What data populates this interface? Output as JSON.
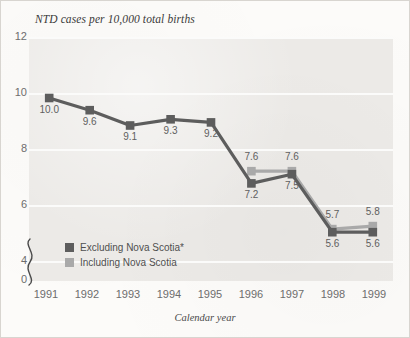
{
  "chart_data": {
    "type": "line",
    "title": "NTD cases per 10,000 total births",
    "xlabel": "Calendar year",
    "ylabel": "",
    "categories": [
      "1991",
      "1992",
      "1993",
      "1994",
      "1995",
      "1996",
      "1997",
      "1998",
      "1999"
    ],
    "x": [
      1991,
      1992,
      1993,
      1994,
      1995,
      1996,
      1997,
      1998,
      1999
    ],
    "ylim": [
      4,
      12
    ],
    "y_ticks": [
      "12",
      "10",
      "8",
      "6",
      "4",
      "0"
    ],
    "y_tick_values": [
      12,
      10,
      8,
      6,
      4,
      0
    ],
    "axis_break": true,
    "axis_break_between": [
      0,
      4
    ],
    "grid": true,
    "grid_axis": "y",
    "legend_position": "inside-bottom-left",
    "series": [
      {
        "name": "Excluding Nova Scotia*",
        "color": "#5d5d5d",
        "values": [
          10.0,
          9.6,
          9.1,
          9.3,
          9.2,
          7.2,
          7.5,
          5.6,
          5.6
        ],
        "labels": [
          "10.0",
          "9.6",
          "9.1",
          "9.3",
          "9.2",
          "7.2",
          "7.5",
          "5.6",
          "5.6"
        ],
        "label_positions": [
          "below",
          "below",
          "below",
          "below",
          "below",
          "below",
          "below",
          "below",
          "below"
        ]
      },
      {
        "name": "Including Nova Scotia",
        "color": "#a9a9a9",
        "values": [
          null,
          null,
          null,
          null,
          null,
          7.6,
          7.6,
          5.7,
          5.8
        ],
        "labels": [
          "",
          "",
          "",
          "",
          "",
          "7.6",
          "7.6",
          "5.7",
          "5.8"
        ],
        "label_positions": [
          "",
          "",
          "",
          "",
          "",
          "above",
          "above",
          "above",
          "above"
        ]
      }
    ]
  },
  "chart": {
    "title": "NTD cases per 10,000 total births",
    "xlabel": "Calendar year",
    "ytick_labels": [
      "12",
      "10",
      "8",
      "6",
      "4",
      "0"
    ],
    "xtick_labels": [
      "1991",
      "1992",
      "1993",
      "1994",
      "1995",
      "1996",
      "1997",
      "1998",
      "1999"
    ]
  },
  "legend": {
    "items": [
      {
        "label": "Excluding Nova Scotia*",
        "color": "#5d5d5d"
      },
      {
        "label": "Including Nova Scotia",
        "color": "#a9a9a9"
      }
    ]
  },
  "colors": {
    "series_dark": "#5d5d5d",
    "series_light": "#a9a9a9",
    "plot_background": "#eceae7",
    "gridline": "#fbfbfa",
    "page_background": "#fcfbf9",
    "axis_text": "#6d6d6d"
  }
}
